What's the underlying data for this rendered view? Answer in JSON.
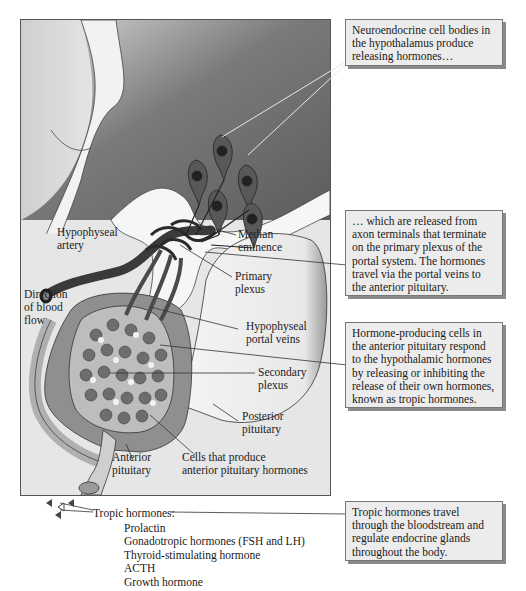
{
  "figure": {
    "colors": {
      "background": "#e6e6e6",
      "brain_gradient_dark": "#6a6a6a",
      "brain_gradient_light": "#d8d8d8",
      "vessel": "#3a3a3a",
      "callout_bg": "#ececec",
      "callout_shadow": "#8a8a8a"
    }
  },
  "labels": {
    "hypophyseal_artery": [
      "Hypophyseal",
      "artery"
    ],
    "direction_of_blood_flow": [
      "Direction",
      "of blood",
      "flow"
    ],
    "median_eminence": [
      "Median",
      "eminence"
    ],
    "primary_plexus": [
      "Primary",
      "plexus"
    ],
    "hypophyseal_portal_veins": [
      "Hypophyseal",
      "portal veins"
    ],
    "secondary_plexus": [
      "Secondary",
      "plexus"
    ],
    "posterior_pituitary": [
      "Posterior",
      "pituitary"
    ],
    "anterior_pituitary": [
      "Anterior",
      "pituitary"
    ],
    "cells_that_produce": [
      "Cells that produce",
      "anterior pituitary hormones"
    ]
  },
  "tropic_hormones": {
    "heading": "Tropic hormones:",
    "items": [
      "Prolactin",
      "Gonadotropic hormones (FSH and LH)",
      "Thyroid-stimulating hormone",
      "ACTH",
      "Growth hormone"
    ]
  },
  "callouts": [
    {
      "text": "Neuroendocrine cell bodies in the hypothalamus produce releasing hormones…"
    },
    {
      "text": "… which are released from axon terminals that terminate on the primary plexus of the portal system. The hormones travel via the portal veins to the anterior pituitary."
    },
    {
      "text": "Hormone-producing cells in the anterior pituitary respond to the hypothalamic hormones by releasing or inhibiting the release of their own hormones, known as tropic hormones."
    },
    {
      "text": "Tropic hormones travel through the bloodstream and regulate endocrine glands throughout the body."
    }
  ]
}
